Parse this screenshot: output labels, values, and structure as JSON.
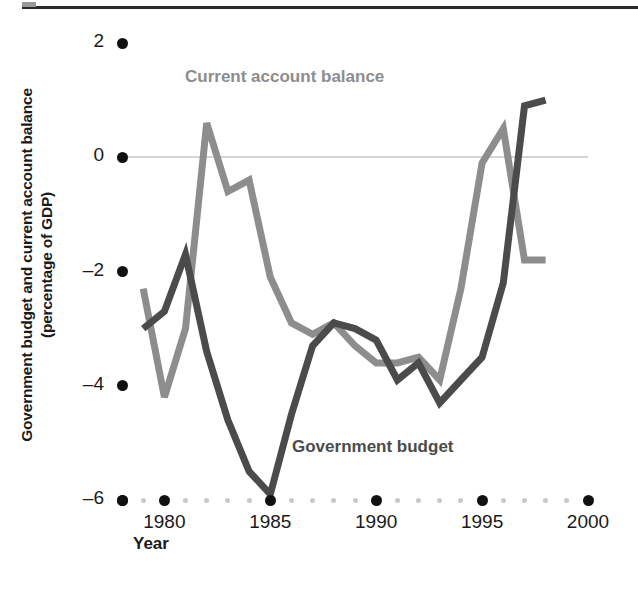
{
  "figure": {
    "y_axis_title": "Government budget and current account balance (percentage of GDP)",
    "y_axis_title_line1": "Government budget and current account balance",
    "y_axis_title_line2": "(percentage of GDP)",
    "x_axis_title": "Year",
    "series_label_current_account": "Current account balance",
    "series_label_government_budget": "Government budget",
    "color_current_account": "#8d8d8d",
    "color_government_budget": "#4b4b4b",
    "color_zero_line": "#d5d5d5",
    "color_tick_dot": "#111111",
    "color_minor_dot": "#c9c9c9"
  },
  "chart_data": {
    "type": "line",
    "title": "",
    "xlabel": "Year",
    "ylabel": "Government budget and current account balance (percentage of GDP)",
    "xlim": [
      1978,
      2000
    ],
    "ylim": [
      -6,
      2
    ],
    "xticks": [
      1980,
      1985,
      1990,
      1995,
      2000
    ],
    "xtick_labels": [
      "1980",
      "1985",
      "1990",
      "1995",
      "2000"
    ],
    "yticks": [
      2,
      0,
      -2,
      -4,
      -6
    ],
    "ytick_labels": [
      "2",
      "0",
      "-2",
      "-4",
      "-6"
    ],
    "grid": false,
    "zero_line": 0,
    "legend": "inline-annotations",
    "x": [
      1979,
      1980,
      1981,
      1982,
      1983,
      1984,
      1985,
      1986,
      1987,
      1988,
      1989,
      1990,
      1991,
      1992,
      1993,
      1994,
      1995,
      1996,
      1997,
      1998
    ],
    "series": [
      {
        "name": "Current account balance",
        "color": "#8d8d8d",
        "values": [
          -2.3,
          -4.2,
          -3.0,
          0.6,
          -0.6,
          -0.4,
          -2.1,
          -2.9,
          -3.1,
          -2.9,
          -3.3,
          -3.6,
          -3.6,
          -3.5,
          -3.9,
          -2.3,
          -0.1,
          0.5,
          -1.8,
          -1.8
        ]
      },
      {
        "name": "Government budget",
        "color": "#4b4b4b",
        "values": [
          -3.0,
          -2.7,
          -1.7,
          -3.4,
          -4.6,
          -5.5,
          -5.9,
          -4.5,
          -3.3,
          -2.9,
          -3.0,
          -3.2,
          -3.9,
          -3.6,
          -4.3,
          -3.9,
          -3.5,
          -2.2,
          0.9,
          1.0
        ]
      }
    ]
  }
}
